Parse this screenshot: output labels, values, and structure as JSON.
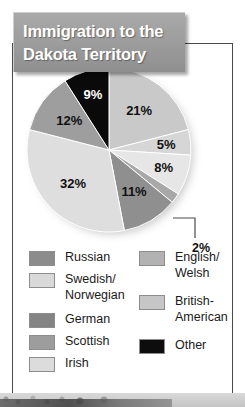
{
  "title": {
    "line1": "Immigration to the",
    "line2": "Dakota Territory"
  },
  "chart_data": {
    "type": "pie",
    "title": "Immigration to the Dakota Territory",
    "legend_position": "bottom",
    "categories": [
      "Russian",
      "Swedish/\nNorwegian",
      "German",
      "Scottish",
      "Irish",
      "English/\nWelsh",
      "British-\nAmerican",
      "Other"
    ],
    "slices": [
      {
        "label": "21%",
        "value": 21,
        "color": "#c9c9c9"
      },
      {
        "label": "5%",
        "value": 5,
        "color": "#d6d6d6"
      },
      {
        "label": "8%",
        "value": 8,
        "color": "#e6e6e6"
      },
      {
        "label": "2%",
        "value": 2,
        "color": "#a8a8a8"
      },
      {
        "label": "11%",
        "value": 11,
        "color": "#8f8f8f"
      },
      {
        "label": "32%",
        "value": 32,
        "color": "#dedede"
      },
      {
        "label": "12%",
        "value": 12,
        "color": "#9e9e9e"
      },
      {
        "label": "9%",
        "value": 9,
        "color": "#0a0a0a"
      }
    ],
    "values": [
      21,
      5,
      8,
      2,
      11,
      32,
      12,
      9
    ],
    "labels": [
      "21%",
      "5%",
      "8%",
      "2%",
      "11%",
      "32%",
      "12%",
      "9%"
    ],
    "callout": "2%"
  },
  "legend": {
    "left": [
      {
        "label": "Russian",
        "color": "#8c8c8c"
      },
      {
        "label": "Swedish/\nNorwegian",
        "color": "#d9d9d9"
      },
      {
        "label": "German",
        "color": "#848484"
      },
      {
        "label": "Scottish",
        "color": "#9d9d9d"
      },
      {
        "label": "Irish",
        "color": "#dcdcdc"
      }
    ],
    "right": [
      {
        "label": "English/\nWelsh",
        "color": "#b2b2b2"
      },
      {
        "label": "British-\nAmerican",
        "color": "#c6c6c6"
      },
      {
        "label": "Other",
        "color": "#0d0d0d"
      }
    ]
  }
}
